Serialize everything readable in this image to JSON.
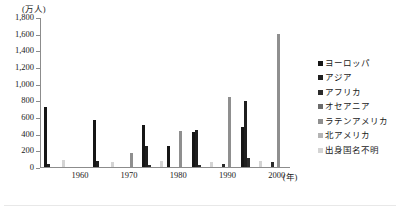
{
  "chart_data": {
    "type": "bar",
    "title": "",
    "xlabel": "年",
    "ylabel": "万人",
    "y_unit_label": "(万人)",
    "x_unit_label": "(年)",
    "ylim": [
      0,
      1800
    ],
    "grid": false,
    "legend_position": "right",
    "categories": [
      "1955",
      "1960",
      "1965",
      "1970",
      "1975",
      "1980",
      "1985",
      "1990",
      "1995",
      "2000"
    ],
    "tick_labels_y": [
      "1,800",
      "1,600",
      "1,400",
      "1,200",
      "1,000",
      "800",
      "600",
      "400",
      "200",
      "0"
    ],
    "tick_values_y": [
      1800,
      1600,
      1400,
      1200,
      1000,
      800,
      600,
      400,
      200,
      0
    ],
    "tick_labels_x": [
      "1960",
      "1970",
      "1980",
      "1990",
      "2000"
    ],
    "series": [
      {
        "name": "ヨーロッパ",
        "color": "#161616",
        "values": [
          720,
          0,
          570,
          0,
          510,
          250,
          420,
          0,
          480,
          0
        ]
      },
      {
        "name": "アジア",
        "color": "#1f1f1f",
        "values": [
          40,
          0,
          75,
          0,
          250,
          0,
          450,
          0,
          790,
          0
        ]
      },
      {
        "name": "アフリカ",
        "color": "#2b2b2b",
        "values": [
          0,
          0,
          0,
          0,
          20,
          0,
          30,
          40,
          110,
          60
        ]
      },
      {
        "name": "オセアニア",
        "color": "#6b6b6b",
        "values": [
          0,
          0,
          0,
          0,
          0,
          0,
          0,
          0,
          0,
          0
        ]
      },
      {
        "name": "ラテンアメリカ",
        "color": "#8f8f8f",
        "values": [
          0,
          0,
          0,
          170,
          0,
          430,
          0,
          840,
          0,
          1600
        ]
      },
      {
        "name": "北アメリカ",
        "color": "#b4b4b4",
        "values": [
          0,
          0,
          0,
          0,
          0,
          0,
          0,
          0,
          0,
          0
        ]
      },
      {
        "name": "出身国名不明",
        "color": "#d4d4d4",
        "values": [
          90,
          0,
          65,
          0,
          75,
          0,
          60,
          0,
          70,
          0
        ]
      }
    ]
  }
}
